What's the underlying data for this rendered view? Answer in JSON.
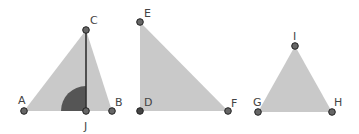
{
  "colors": {
    "fill": "#c9c9c9",
    "angle_fill": "#555555",
    "segment": "#333333",
    "point_fill": "#666666",
    "point_stroke": "#222222",
    "label": "#444444"
  },
  "triangles": [
    {
      "name": "ABC",
      "vertices": [
        "A",
        "B",
        "C"
      ],
      "altitude": {
        "from": "C",
        "foot": "J"
      },
      "right_angle_marker_at": "J"
    },
    {
      "name": "DEF",
      "vertices": [
        "D",
        "E",
        "F"
      ]
    },
    {
      "name": "GHI",
      "vertices": [
        "G",
        "H",
        "I"
      ]
    }
  ],
  "labels": {
    "A": "A",
    "B": "B",
    "C": "C",
    "J": "J",
    "D": "D",
    "E": "E",
    "F": "F",
    "G": "G",
    "H": "H",
    "I": "I"
  }
}
